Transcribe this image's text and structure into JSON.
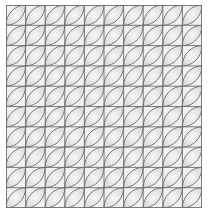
{
  "pattern": {
    "name": "leaf tile grid",
    "columns": 10,
    "rows": 10,
    "leaf_orientation": "bottom-left-to-top-right",
    "colors": {
      "background": "#ffffff",
      "panel": "#f1f1f1",
      "leaf_fill": "#e3e3e3",
      "line": "#5a5a5a",
      "grid_line": "#6e6e6e"
    }
  }
}
